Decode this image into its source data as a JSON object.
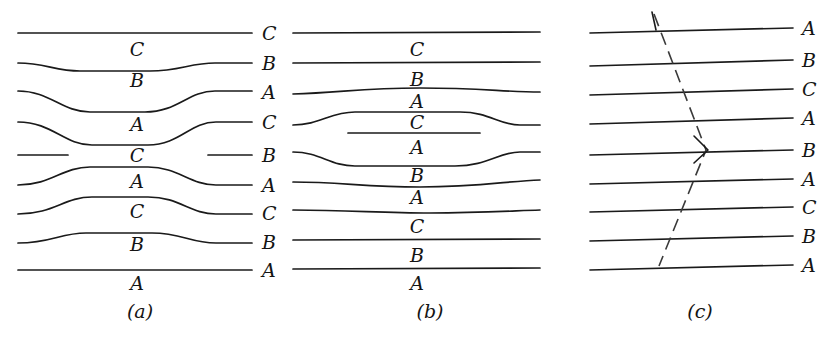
{
  "figure": {
    "width": 834,
    "height": 341,
    "background": "#ffffff",
    "line_color": "#1a1a1a",
    "fault_color": "#3a3a3a",
    "text_color": "#141414"
  },
  "panels": [
    {
      "id": "a",
      "caption": "(a)",
      "caption_x": 140,
      "caption_y": 300,
      "interior_labels": [
        "C",
        "B",
        "A",
        "C",
        "A",
        "C",
        "B",
        "A"
      ],
      "right_edge_labels": [
        "C",
        "B",
        "A",
        "C",
        "B",
        "A",
        "C",
        "B",
        "A"
      ],
      "bed_count": 9
    },
    {
      "id": "b",
      "caption": "(b)",
      "caption_x": 430,
      "caption_y": 300,
      "interior_labels": [
        "C",
        "B",
        "A",
        "C",
        "A",
        "B",
        "A",
        "C",
        "B",
        "A"
      ],
      "bed_count": 9,
      "truncated_segment_label": "A"
    },
    {
      "id": "c",
      "caption": "(c)",
      "caption_x": 700,
      "caption_y": 300,
      "right_edge_labels": [
        "A",
        "B",
        "C",
        "A",
        "B",
        "A",
        "C",
        "B",
        "A"
      ],
      "bed_count": 9,
      "fault": {
        "style": "dashed",
        "shape": "zigzag",
        "vertex_x": 706,
        "vertex_y": 150,
        "top_x": 654,
        "top_y": 14,
        "bottom_x": 659,
        "bottom_y": 266,
        "has_arrow": true
      }
    }
  ],
  "unit_names": [
    "A",
    "B",
    "C"
  ],
  "bed_y_positions": [
    33,
    66,
    95,
    124,
    155,
    183,
    212,
    240,
    270
  ]
}
